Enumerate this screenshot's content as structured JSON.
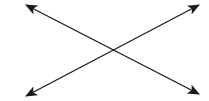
{
  "diagram": {
    "background": "#ffffff",
    "stroke_color": "#1a1a1a",
    "stroke_width": 1.3,
    "crossing_point": {
      "x": 112,
      "y": 50
    },
    "lines": [
      {
        "id": "line-descending",
        "description": "double-headed arrow from top-left to bottom-right",
        "from": {
          "x": 26,
          "y": 5
        },
        "to": {
          "x": 199,
          "y": 94
        },
        "heads": [
          "start",
          "end"
        ]
      },
      {
        "id": "line-ascending",
        "description": "double-headed arrow from bottom-left to top-right",
        "from": {
          "x": 26,
          "y": 96
        },
        "to": {
          "x": 199,
          "y": 5
        },
        "heads": [
          "start",
          "end"
        ]
      }
    ]
  }
}
